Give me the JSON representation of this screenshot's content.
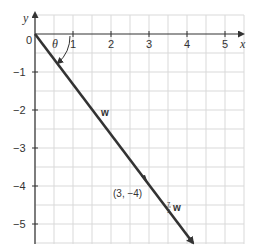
{
  "diagram": {
    "axes": {
      "x_label": "x",
      "y_label": "y",
      "origin_label": "0",
      "x_ticks": [
        "1",
        "2",
        "3",
        "4",
        "5"
      ],
      "y_ticks": [
        "−1",
        "−2",
        "−3",
        "−4",
        "−5"
      ]
    },
    "angle_label": "θ",
    "vector_w_label": "w",
    "scaled_vector": {
      "coef_num": "7",
      "coef_den": "5",
      "label": "w"
    },
    "point_label": "(3, −4)",
    "colors": {
      "grid": "#d9d9d9",
      "axis": "#333333",
      "vector": "#333333"
    }
  }
}
